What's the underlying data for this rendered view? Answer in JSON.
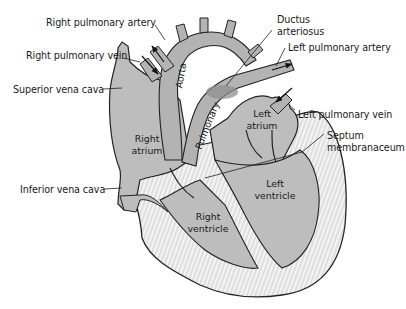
{
  "diagram": {
    "colors": {
      "chamber_fill": "#bdbdbd",
      "vessel_fill": "#b3b3b3",
      "wall_fill": "#f4f4f4",
      "outline": "#222222",
      "ductus_shade": "#8f8f8f",
      "background": "#ffffff"
    },
    "external_labels": {
      "right_pulmonary_artery": "Right pulmonary artery",
      "right_pulmonary_vein": "Right pulmonary vein",
      "superior_vena_cava": "Superior vena cava",
      "inferior_vena_cava": "Inferior vena cava",
      "ductus_line1": "Ductus",
      "ductus_line2": "arteriosus",
      "left_pulmonary_artery": "Left pulmonary artery",
      "left_pulmonary_vein": "Left pulmonary vein",
      "septum_line1": "Septum",
      "septum_line2": "membranaceum"
    },
    "internal_labels": {
      "right_atrium_1": "Right",
      "right_atrium_2": "atrium",
      "left_atrium_1": "Left",
      "left_atrium_2": "atrium",
      "right_ventricle_1": "Right",
      "right_ventricle_2": "ventricle",
      "left_ventricle_1": "Left",
      "left_ventricle_2": "ventricle",
      "aorta": "Aorta",
      "pulmonary": "Pulmonary"
    }
  }
}
